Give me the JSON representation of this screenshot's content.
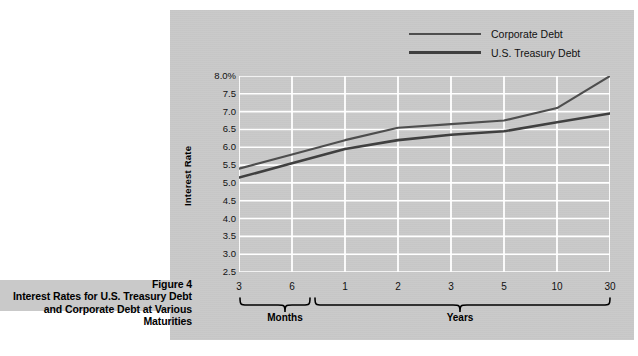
{
  "figure": {
    "number_label": "Figure 4",
    "caption_line_1": "Interest Rates for U.S. Treasury",
    "caption_line_2": "Debt and Corporate Debt at",
    "caption_line_3": "Various Maturities"
  },
  "legend": {
    "position": "top-right",
    "entries": [
      {
        "label": "Corporate Debt",
        "color": "#4e4e4e"
      },
      {
        "label": "U.S. Treasury Debt",
        "color": "#404040"
      }
    ]
  },
  "axes": {
    "y_title": "Interest Rate",
    "y_tick_labels": [
      "8.0%",
      "7.5",
      "7.0",
      "6.5",
      "6.0",
      "5.5",
      "5.0",
      "4.5",
      "4.0",
      "3.5",
      "3.0",
      "2.5"
    ],
    "x_tick_labels": [
      "3",
      "6",
      "1",
      "2",
      "3",
      "5",
      "10",
      "30"
    ],
    "group_labels": [
      "Months",
      "Years"
    ]
  },
  "colors": {
    "panel_background": "#c9c9c9",
    "gridline": "#ffffff",
    "corporate_line": "#4e4e4e",
    "treasury_line": "#404040",
    "page_background": "#ffffff"
  },
  "chart_data": {
    "type": "line",
    "title": "Interest Rates for U.S. Treasury Debt and Corporate Debt at Various Maturities",
    "xlabel": "",
    "ylabel": "Interest Rate",
    "ylim": [
      2.5,
      8.0
    ],
    "y_tick_values": [
      2.5,
      3.0,
      3.5,
      4.0,
      4.5,
      5.0,
      5.5,
      6.0,
      6.5,
      7.0,
      7.5,
      8.0
    ],
    "grid": true,
    "legend_position": "top-right",
    "x": [
      "3",
      "6",
      "1",
      "2",
      "3",
      "5",
      "10",
      "30"
    ],
    "categories": [
      "3",
      "6",
      "1",
      "2",
      "3",
      "5",
      "10",
      "30"
    ],
    "x_units": [
      "Months",
      "Months",
      "Years",
      "Years",
      "Years",
      "Years",
      "Years",
      "Years"
    ],
    "series": [
      {
        "name": "Corporate Debt",
        "color": "#4e4e4e",
        "values": [
          5.4,
          5.8,
          6.2,
          6.55,
          6.65,
          6.75,
          7.1,
          8.0
        ]
      },
      {
        "name": "U.S. Treasury Debt",
        "color": "#404040",
        "values": [
          5.15,
          5.55,
          5.95,
          6.2,
          6.35,
          6.45,
          6.7,
          6.95
        ]
      }
    ]
  }
}
